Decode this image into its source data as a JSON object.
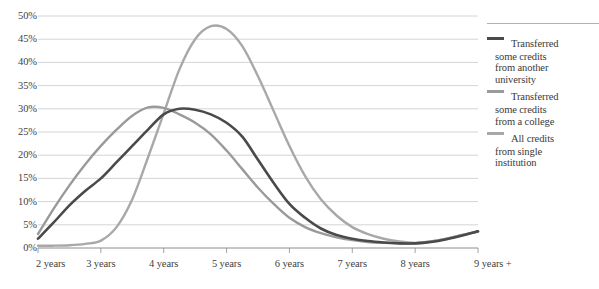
{
  "chart_data": {
    "type": "line",
    "title": "",
    "xlabel": "",
    "ylabel": "",
    "categories": [
      "2 years",
      "3 years",
      "4 years",
      "5 years",
      "6 years",
      "7 years",
      "8 years",
      "9 years +"
    ],
    "ylim": [
      0,
      50
    ],
    "ytick_labels": [
      "0%",
      "5%",
      "10%",
      "15%",
      "20%",
      "25%",
      "30%",
      "35%",
      "40%",
      "45%",
      "50%"
    ],
    "ytick_values": [
      0,
      5,
      10,
      15,
      20,
      25,
      30,
      35,
      40,
      45,
      50
    ],
    "grid": true,
    "legend_position": "right",
    "x_fine": [
      2.0,
      2.25,
      2.5,
      2.75,
      3.0,
      3.25,
      3.5,
      3.75,
      4.0,
      4.25,
      4.5,
      4.75,
      5.0,
      5.25,
      5.5,
      5.75,
      6.0,
      6.25,
      6.5,
      6.75,
      7.0,
      7.25,
      7.5,
      7.75,
      8.0,
      8.25,
      8.5,
      8.75,
      9.0
    ],
    "series": [
      {
        "name": "Transferred some credits from another university",
        "color": "#4a4a4a",
        "values_at_categories": [
          2,
          15,
          29,
          24,
          7,
          2,
          1,
          3.5
        ],
        "values_fine": [
          2,
          5.5,
          9.2,
          12.3,
          15,
          18.5,
          22,
          25.5,
          28.8,
          30,
          29.8,
          28.8,
          27,
          24,
          19,
          14,
          9.5,
          6.5,
          4.2,
          2.8,
          2.0,
          1.5,
          1.2,
          1.0,
          1.0,
          1.3,
          1.9,
          2.7,
          3.6
        ]
      },
      {
        "name": "Transferred some credits from a college",
        "color": "#9a9a9a",
        "values_at_categories": [
          3,
          22,
          29,
          16,
          5,
          2,
          1,
          3.5
        ],
        "values_fine": [
          3,
          8.5,
          13.5,
          18,
          22,
          25.5,
          28.5,
          30.3,
          30.2,
          28.8,
          27,
          24.5,
          21,
          17,
          13,
          9.5,
          6.5,
          4.5,
          3.2,
          2.3,
          1.7,
          1.3,
          1.1,
          1.0,
          1.0,
          1.4,
          2.0,
          2.8,
          3.6
        ]
      },
      {
        "name": "All credits from single institution",
        "color": "#a8a8a8",
        "values_at_categories": [
          0.5,
          1.5,
          29,
          35,
          9,
          2,
          1,
          3.5
        ],
        "values_fine": [
          0.5,
          0.5,
          0.6,
          0.9,
          1.6,
          4.5,
          10.5,
          19.5,
          29,
          38.5,
          45,
          47.8,
          47.2,
          43.5,
          37,
          29.5,
          22,
          15.5,
          10.5,
          7.0,
          4.5,
          3.0,
          2.0,
          1.4,
          1.1,
          1.4,
          2.0,
          2.8,
          3.5
        ]
      }
    ],
    "legend": [
      {
        "label": "Transferred some credits from another university",
        "lines": [
          "Transferred",
          "some credits",
          "from another",
          "university"
        ],
        "color": "#4a4a4a"
      },
      {
        "label": "Transferred some credits from a college",
        "lines": [
          "Transferred",
          "some credits",
          "from a college"
        ],
        "color": "#9a9a9a"
      },
      {
        "label": "All credits from single institution",
        "lines": [
          "All credits",
          "from single",
          "institution"
        ],
        "color": "#a8a8a8"
      }
    ]
  },
  "axes": {
    "gridline_color": "#c9c9c9",
    "axis_color": "#8c8c8c"
  }
}
